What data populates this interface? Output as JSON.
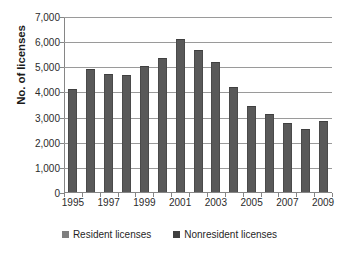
{
  "chart_data": {
    "type": "bar",
    "title": "",
    "xlabel": "",
    "ylabel": "No. of licenses",
    "ylim": [
      0,
      7000
    ],
    "ytick_step": 1000,
    "grid": true,
    "legend_position": "bottom",
    "bar_color": "#595959",
    "gridline_color": "#9a9a9a",
    "axis_color": "#868686",
    "x": [
      1995,
      1996,
      1997,
      1998,
      1999,
      2000,
      2001,
      2002,
      2003,
      2004,
      2005,
      2006,
      2007,
      2008,
      2009
    ],
    "categories": [
      "1995",
      "1996",
      "1997",
      "1998",
      "1999",
      "2000",
      "2001",
      "2002",
      "2003",
      "2004",
      "2005",
      "2006",
      "2007",
      "2008",
      "2009"
    ],
    "values": [
      4110,
      4890,
      4700,
      4660,
      5030,
      5350,
      6080,
      5630,
      5180,
      4170,
      3430,
      3100,
      2730,
      2520,
      2830
    ],
    "y_tick_labels": [
      "7,000",
      "6,000",
      "5,000",
      "4,000",
      "3,000",
      "2,000",
      "1,000",
      "0"
    ],
    "y_tick_values": [
      7000,
      6000,
      5000,
      4000,
      3000,
      2000,
      1000,
      0
    ],
    "x_tick_labels": [
      "1995",
      "1997",
      "1999",
      "2001",
      "2003",
      "2005",
      "2007",
      "2009"
    ],
    "x_tick_values": [
      1995,
      1997,
      1999,
      2001,
      2003,
      2005,
      2007,
      2009
    ],
    "legend": [
      {
        "label": "Resident licenses",
        "color": "#7f7f7f"
      },
      {
        "label": "Nonresident licenses",
        "color": "#404040"
      }
    ]
  }
}
